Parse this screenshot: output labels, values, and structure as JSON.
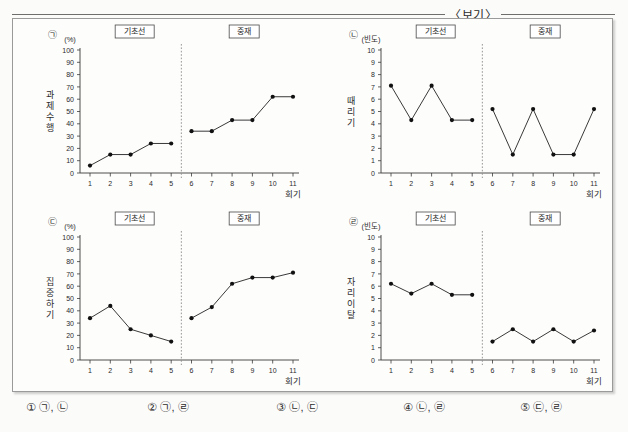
{
  "header": {
    "title": "〈보기〉"
  },
  "panel_labels": {
    "baseline": "기초선",
    "intervention": "중재"
  },
  "axis": {
    "x_name": "회기",
    "unit_percent": "(%)",
    "unit_frequency": "(빈도)"
  },
  "answers": {
    "options": [
      {
        "num": "①",
        "text": "㉠, ㉡"
      },
      {
        "num": "②",
        "text": "㉠, ㉣"
      },
      {
        "num": "③",
        "text": "㉡, ㉢"
      },
      {
        "num": "④",
        "text": "㉡, ㉣"
      },
      {
        "num": "⑤",
        "text": "㉢, ㉣"
      }
    ]
  },
  "chart_data": [
    {
      "id": "chart-a",
      "marker": "㉠",
      "type": "line",
      "title": "",
      "ylabel": "과제수행",
      "ylabel_chars": [
        "과",
        "제",
        "수",
        "행"
      ],
      "xlabel": "회기",
      "yunit": "(%)",
      "ylim": [
        0,
        100
      ],
      "yticks": [
        0,
        10,
        20,
        30,
        40,
        50,
        60,
        70,
        80,
        90,
        100
      ],
      "xticks": [
        1,
        2,
        3,
        4,
        5,
        6,
        7,
        8,
        9,
        10,
        11
      ],
      "xlim": [
        1,
        11
      ],
      "grid": false,
      "phase_split_after": 5,
      "phase_labels": [
        "기초선",
        "중재"
      ],
      "series": [
        {
          "name": "기초선",
          "x": [
            1,
            2,
            3,
            4,
            5
          ],
          "values": [
            6,
            15,
            15,
            24,
            24
          ]
        },
        {
          "name": "중재",
          "x": [
            6,
            7,
            8,
            9,
            10,
            11
          ],
          "values": [
            34,
            34,
            43,
            43,
            62,
            62
          ]
        }
      ]
    },
    {
      "id": "chart-b",
      "marker": "㉡",
      "type": "line",
      "title": "",
      "ylabel": "때리기",
      "ylabel_chars": [
        "때",
        "리",
        "기"
      ],
      "xlabel": "회기",
      "yunit": "(빈도)",
      "ylim": [
        0,
        10
      ],
      "yticks": [
        0,
        1,
        2,
        3,
        4,
        5,
        6,
        7,
        8,
        9,
        10
      ],
      "xticks": [
        1,
        2,
        3,
        4,
        5,
        6,
        7,
        8,
        9,
        10,
        11
      ],
      "xlim": [
        1,
        11
      ],
      "grid": false,
      "phase_split_after": 5,
      "phase_labels": [
        "기초선",
        "중재"
      ],
      "series": [
        {
          "name": "기초선",
          "x": [
            1,
            2,
            3,
            4,
            5
          ],
          "values": [
            7.1,
            4.3,
            7.1,
            4.3,
            4.3
          ]
        },
        {
          "name": "중재",
          "x": [
            6,
            7,
            8,
            9,
            10,
            11
          ],
          "values": [
            5.2,
            1.5,
            5.2,
            1.5,
            1.5,
            5.2
          ]
        }
      ]
    },
    {
      "id": "chart-c",
      "marker": "㉢",
      "type": "line",
      "title": "",
      "ylabel": "집중하기",
      "ylabel_chars": [
        "집",
        "중",
        "하",
        "기"
      ],
      "xlabel": "회기",
      "yunit": "(%)",
      "ylim": [
        0,
        100
      ],
      "yticks": [
        0,
        10,
        20,
        30,
        40,
        50,
        60,
        70,
        80,
        90,
        100
      ],
      "xticks": [
        1,
        2,
        3,
        4,
        5,
        6,
        7,
        8,
        9,
        10,
        11
      ],
      "xlim": [
        1,
        11
      ],
      "grid": false,
      "phase_split_after": 5,
      "phase_labels": [
        "기초선",
        "중재"
      ],
      "series": [
        {
          "name": "기초선",
          "x": [
            1,
            2,
            3,
            4,
            5
          ],
          "values": [
            34,
            44,
            25,
            20,
            15
          ]
        },
        {
          "name": "중재",
          "x": [
            6,
            7,
            8,
            9,
            10,
            11
          ],
          "values": [
            34,
            43,
            62,
            67,
            67,
            71
          ]
        }
      ]
    },
    {
      "id": "chart-d",
      "marker": "㉣",
      "type": "line",
      "title": "",
      "ylabel": "자리이탈",
      "ylabel_chars": [
        "자",
        "리",
        "이",
        "탈"
      ],
      "xlabel": "회기",
      "yunit": "(빈도)",
      "ylim": [
        0,
        10
      ],
      "yticks": [
        0,
        1,
        2,
        3,
        4,
        5,
        6,
        7,
        8,
        9,
        10
      ],
      "xticks": [
        1,
        2,
        3,
        4,
        5,
        6,
        7,
        8,
        9,
        10,
        11
      ],
      "xlim": [
        1,
        11
      ],
      "grid": false,
      "phase_split_after": 5,
      "phase_labels": [
        "기초선",
        "중재"
      ],
      "series": [
        {
          "name": "기초선",
          "x": [
            1,
            2,
            3,
            4,
            5
          ],
          "values": [
            6.2,
            5.4,
            6.2,
            5.3,
            5.3
          ]
        },
        {
          "name": "중재",
          "x": [
            6,
            7,
            8,
            9,
            10,
            11
          ],
          "values": [
            1.5,
            2.5,
            1.5,
            2.5,
            1.5,
            2.4
          ]
        }
      ]
    }
  ]
}
